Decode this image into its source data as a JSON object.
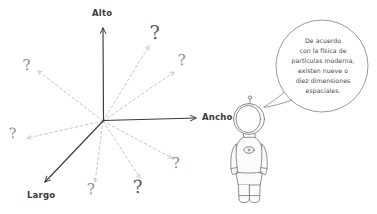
{
  "illustration": {
    "title": "Dimensiones espaciales",
    "background_color": "#ffffff",
    "ink_color": "#3a3a3a",
    "dashed_color": "#b9b9b9",
    "question_color": "#8e8e8e"
  },
  "axes": [
    {
      "name": "alto",
      "label": "Alto",
      "style": "solid",
      "arrow": true
    },
    {
      "name": "ancho",
      "label": "Ancho",
      "style": "solid",
      "arrow": true
    },
    {
      "name": "largo",
      "label": "Largo",
      "style": "solid",
      "arrow": true
    }
  ],
  "extra_dimensions": [
    {
      "id": 1,
      "glyph": "?",
      "shade": "light"
    },
    {
      "id": 2,
      "glyph": "?",
      "shade": "dark"
    },
    {
      "id": 3,
      "glyph": "?",
      "shade": "light"
    },
    {
      "id": 4,
      "glyph": "?",
      "shade": "light"
    },
    {
      "id": 5,
      "glyph": "?",
      "shade": "light"
    },
    {
      "id": 6,
      "glyph": "?",
      "shade": "light"
    },
    {
      "id": 7,
      "glyph": "?",
      "shade": "light"
    },
    {
      "id": 8,
      "glyph": "?",
      "shade": "dark"
    }
  ],
  "character": {
    "name": "astronauta",
    "icon": "astronaut-figure"
  },
  "speech_bubble": {
    "lines": [
      "De acuerdo",
      "con la física de",
      "partículas moderna,",
      "existen nueve o",
      "diez dimensiones",
      "espaciales."
    ],
    "full_text": "De acuerdo con la física de partículas moderna, existen nueve o diez dimensiones espaciales."
  }
}
